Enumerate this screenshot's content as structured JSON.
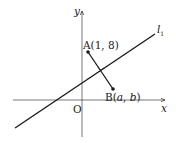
{
  "diagram": {
    "axes": {
      "x_label": "x",
      "y_label": "y",
      "origin_label": "O"
    },
    "line": {
      "label_main": "l",
      "label_sub": "1"
    },
    "points": {
      "A": {
        "name": "A",
        "coords": "(1, 8)"
      },
      "B": {
        "name": "B",
        "open": "(",
        "a": "a",
        "comma": ", ",
        "b": "b",
        "close": ")"
      }
    },
    "annotations": {
      "perpendicular": "right-angle mark where AB meets l1"
    },
    "colors": {
      "stroke": "#1a1a1a",
      "background": "#ffffff"
    }
  }
}
